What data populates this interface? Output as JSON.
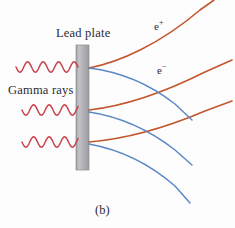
{
  "figure": {
    "panel_caption": "(b)",
    "background_color": "#fdfdfe",
    "width": 235,
    "height": 228
  },
  "labels": {
    "lead_plate": "Lead plate",
    "gamma_rays": "Gamma rays",
    "positron_base": "e",
    "positron_charge": "+",
    "electron_base": "e",
    "electron_charge": "−"
  },
  "colors": {
    "plate_fill": "#a8a8ac",
    "plate_fill_light": "#c2c2c6",
    "plate_stroke": "#8d8d92",
    "gamma_ray": "#c9424a",
    "positron_track": "#c4562c",
    "electron_track": "#5b87c6",
    "text": "#2b2b33"
  },
  "plate": {
    "x": 76,
    "y": 45,
    "width": 13,
    "height": 125
  },
  "gamma_rays": [
    {
      "id": "gamma-ray-1",
      "start_x": 16,
      "y": 67,
      "end_x": 78,
      "amplitude": 5.2,
      "wavelength": 15.5
    },
    {
      "id": "gamma-ray-2",
      "start_x": 22,
      "y": 110,
      "end_x": 78,
      "amplitude": 5.2,
      "wavelength": 15.5
    },
    {
      "id": "gamma-ray-3",
      "start_x": 22,
      "y": 142,
      "end_x": 78,
      "amplitude": 5.2,
      "wavelength": 15.5
    }
  ],
  "tracks": {
    "positron": [
      {
        "id": "positron-track-1",
        "path": "M 89 68 C 120 62, 160 44, 200 10 L 214 0"
      },
      {
        "id": "positron-track-2",
        "path": "M 89 110 C 125 106, 165 92, 205 72 L 232 60"
      },
      {
        "id": "positron-track-3",
        "path": "M 89 142 C 125 139, 165 128, 205 111 L 232 101"
      }
    ],
    "electron": [
      {
        "id": "electron-track-1",
        "path": "M 89 68 C 122 72, 152 86, 175 104 L 192 120"
      },
      {
        "id": "electron-track-2",
        "path": "M 89 112 C 122 117, 152 132, 175 150 L 192 165"
      },
      {
        "id": "electron-track-3",
        "path": "M 89 144 C 122 150, 152 166, 175 186 L 190 203"
      }
    ]
  }
}
